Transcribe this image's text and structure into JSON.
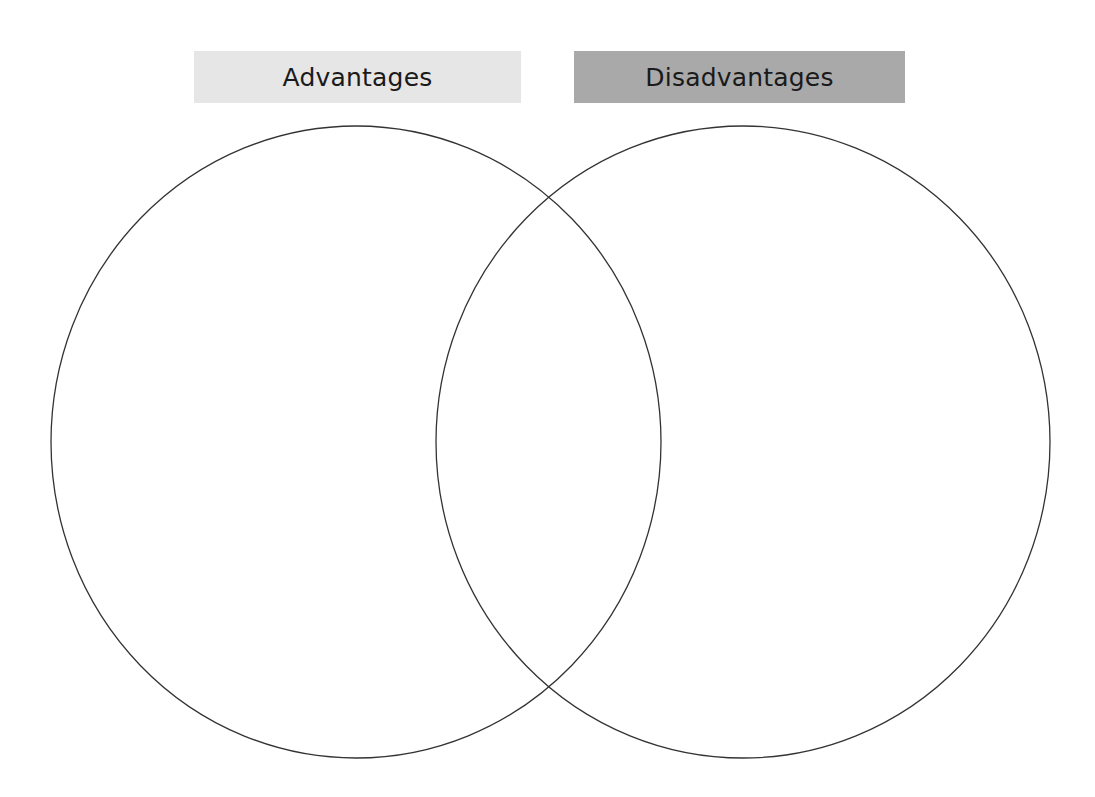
{
  "diagram": {
    "type": "venn",
    "sets": [
      {
        "id": "left",
        "label": "Advantages",
        "label_bg": "#e6e6e6",
        "shape": {
          "cx": 356,
          "cy": 442,
          "rx": 305,
          "ry": 316
        },
        "stroke": "#333333"
      },
      {
        "id": "right",
        "label": "Disadvantages",
        "label_bg": "#a9a9a9",
        "shape": {
          "cx": 743,
          "cy": 442,
          "rx": 307,
          "ry": 316
        },
        "stroke": "#333333"
      }
    ],
    "regions": {
      "left_only": [],
      "overlap": [],
      "right_only": []
    }
  }
}
